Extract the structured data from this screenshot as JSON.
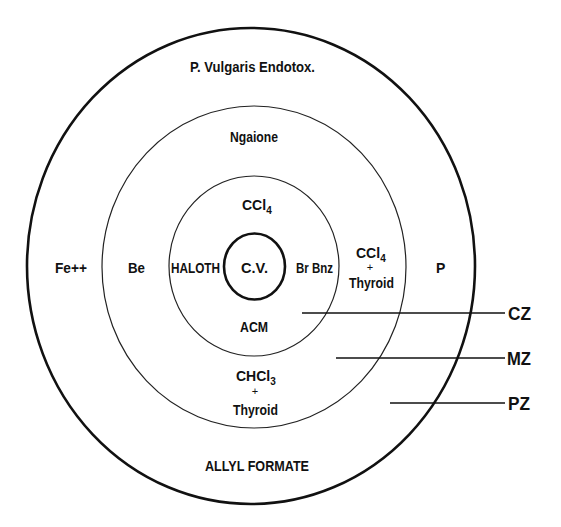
{
  "diagram": {
    "rings": {
      "outer": {
        "label": "P. Vulgaris Endotox."
      },
      "middle": {
        "label": "Ngaione"
      },
      "inner": {
        "label": "CCl4"
      },
      "center": {
        "label": "C.V."
      }
    },
    "labels": {
      "p_vulgaris": "P. Vulgaris Endotox.",
      "ngaione": "Ngaione",
      "ccl4_top_base": "CCl",
      "ccl4_top_sub": "4",
      "fe": "Fe++",
      "be": "Be",
      "haloth": "HALOTH",
      "cv": "C.V.",
      "brbnz": "Br Bnz",
      "ccl4_right_base": "CCl",
      "ccl4_right_sub": "4",
      "plus_right": "+",
      "thyroid_right": "Thyroid",
      "p": "P",
      "acm": "ACM",
      "chcl3_base": "CHCl",
      "chcl3_sub": "3",
      "plus_bottom": "+",
      "thyroid_bottom": "Thyroid",
      "allyl_formate": "ALLYL FORMATE"
    },
    "zones": {
      "cz": "CZ",
      "mz": "MZ",
      "pz": "PZ"
    },
    "colors": {
      "ink": "#111111",
      "background": "#ffffff"
    }
  }
}
